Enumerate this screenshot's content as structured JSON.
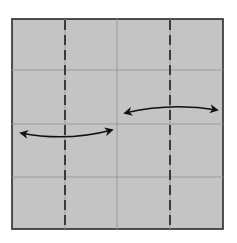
{
  "diagram": {
    "type": "origami-step",
    "colors": {
      "background": "#ffffff",
      "paper": "#c4c4c4",
      "border": "#2a2a2a",
      "crease": "#9a9a9a",
      "fold_line": "#1e1e1e",
      "arrow": "#111111"
    },
    "paper": {
      "x": 12,
      "y": 19,
      "width": 211,
      "height": 210
    },
    "creases": {
      "vertical_x": [
        65,
        117,
        170
      ],
      "horizontal_y": [
        70,
        124,
        177
      ]
    },
    "fold_lines": [
      {
        "name": "left-valley-fold",
        "x": 65,
        "style": "dashed"
      },
      {
        "name": "right-valley-fold",
        "x": 170,
        "style": "dashed"
      }
    ],
    "arrows": [
      {
        "name": "left-double-arrow",
        "x1": 21,
        "y1": 133,
        "x2": 112,
        "y2": 130,
        "ctrl_y": 142,
        "direction": "both"
      },
      {
        "name": "right-double-arrow",
        "x1": 125,
        "y1": 113,
        "x2": 217,
        "y2": 110,
        "ctrl_y": 102,
        "direction": "both"
      }
    ]
  }
}
